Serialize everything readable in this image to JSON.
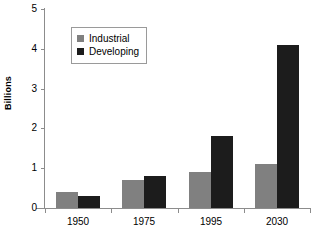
{
  "chart_data": {
    "type": "bar",
    "title": "",
    "xlabel": "",
    "ylabel": "Billions",
    "categories": [
      "1950",
      "1975",
      "1995",
      "2030"
    ],
    "series": [
      {
        "name": "Industrial",
        "color": "#808080",
        "values": [
          0.4,
          0.7,
          0.9,
          1.1
        ]
      },
      {
        "name": "Developing",
        "color": "#1c1c1c",
        "values": [
          0.3,
          0.8,
          1.8,
          4.1
        ]
      }
    ],
    "ylim": [
      0,
      5
    ],
    "ytick_labels": [
      "0",
      "1",
      "2",
      "3",
      "4",
      "5"
    ],
    "ytick_values": [
      0,
      1,
      2,
      3,
      4,
      5
    ],
    "grid": false,
    "legend_position": "upper-left-inside"
  },
  "legend": {
    "entries": [
      {
        "label": "Industrial"
      },
      {
        "label": "Developing"
      }
    ]
  },
  "axis": {
    "y_title": "Billions"
  },
  "colors": {
    "industrial": "#808080",
    "developing": "#1c1c1c",
    "axis": "#8c8c8c",
    "background": "#ffffff"
  }
}
